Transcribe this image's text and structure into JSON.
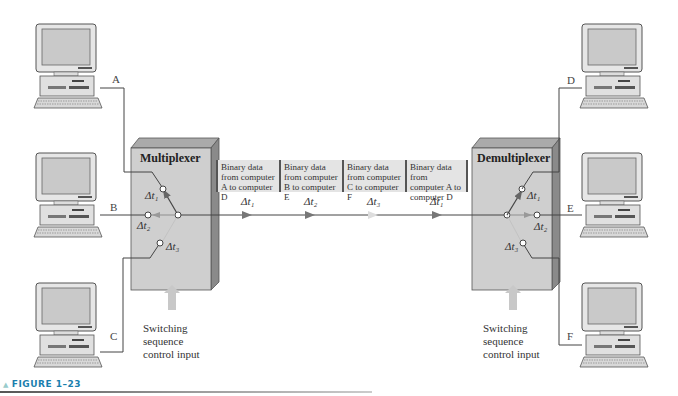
{
  "figure": {
    "caption": "FIGURE 1–23",
    "caption_color": "#1a7fae"
  },
  "multiplexer": {
    "title": "Multiplexer",
    "inputs": [
      "A",
      "B",
      "C"
    ],
    "switch_labels": [
      "Δt₁",
      "Δt₂",
      "Δt₃"
    ],
    "control_label": [
      "Switching",
      "sequence",
      "control input"
    ]
  },
  "demultiplexer": {
    "title": "Demultiplexer",
    "outputs": [
      "D",
      "E",
      "F"
    ],
    "switch_labels": [
      "Δt₁",
      "Δt₂",
      "Δt₃"
    ],
    "control_label": [
      "Switching",
      "sequence",
      "control input"
    ]
  },
  "data_stream": {
    "segments": [
      {
        "text": "Binary data from computer A to computer D",
        "slot": "Δt₁"
      },
      {
        "text": "Binary data from computer B to computer E",
        "slot": "Δt₂"
      },
      {
        "text": "Binary data from computer C to computer F",
        "slot": "Δt₃"
      },
      {
        "text": "Binary data from computer A to computer D",
        "slot": "Δt₁"
      }
    ]
  },
  "colors": {
    "box_face": "#cfcfcf",
    "box_side": "#8a8a8a",
    "arrow_fill": "#c8c8c8"
  }
}
